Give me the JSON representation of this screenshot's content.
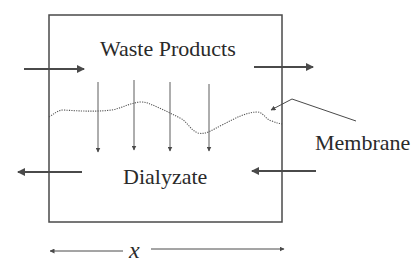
{
  "diagram": {
    "labels": {
      "top_compartment": "Waste Products",
      "bottom_compartment": "Dialyzate",
      "membrane": "Membrane",
      "length_variable": "x"
    },
    "colors": {
      "stroke": "#4a4a4a",
      "text": "#2a2a2a",
      "background": "#ffffff"
    }
  }
}
